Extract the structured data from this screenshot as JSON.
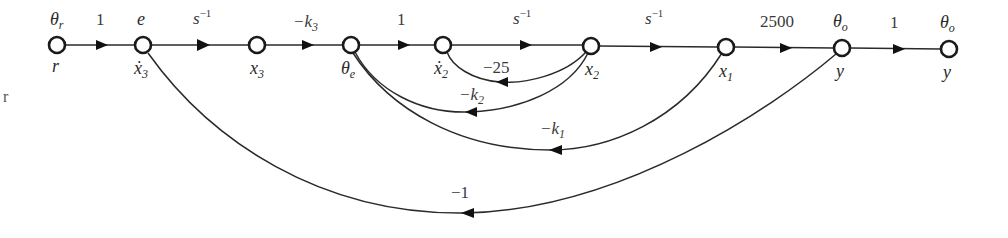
{
  "diagram": {
    "type": "signal-flow-graph",
    "stray_text": "r",
    "nodes": [
      {
        "id": "r",
        "top_label": "θ",
        "top_sub": "r",
        "bottom_label": "r",
        "bottom_sub": ""
      },
      {
        "id": "x3dot",
        "top_label": "e",
        "top_sub": "",
        "bottom_label": "ẋ",
        "bottom_sub": "3"
      },
      {
        "id": "x3",
        "top_label": "",
        "top_sub": "",
        "bottom_label": "x",
        "bottom_sub": "3"
      },
      {
        "id": "thetae",
        "top_label": "",
        "top_sub": "",
        "bottom_label": "θ",
        "bottom_sub": "e"
      },
      {
        "id": "x2dot",
        "top_label": "",
        "top_sub": "",
        "bottom_label": "ẋ",
        "bottom_sub": "2"
      },
      {
        "id": "x2",
        "top_label": "",
        "top_sub": "",
        "bottom_label": "x",
        "bottom_sub": "2"
      },
      {
        "id": "x1",
        "top_label": "",
        "top_sub": "",
        "bottom_label": "x",
        "bottom_sub": "1"
      },
      {
        "id": "y1",
        "top_label": "θ",
        "top_sub": "o",
        "bottom_label": "y",
        "bottom_sub": ""
      },
      {
        "id": "y2",
        "top_label": "θ",
        "top_sub": "o",
        "bottom_label": "y",
        "bottom_sub": ""
      }
    ],
    "forward_branches": [
      {
        "from": "r",
        "to": "x3dot",
        "gain": "1"
      },
      {
        "from": "x3dot",
        "to": "x3",
        "gain_base": "s",
        "gain_sup": "−1"
      },
      {
        "from": "x3",
        "to": "thetae",
        "gain_base": "−k",
        "gain_sub": "3"
      },
      {
        "from": "thetae",
        "to": "x2dot",
        "gain": "1"
      },
      {
        "from": "x2dot",
        "to": "x2",
        "gain_base": "s",
        "gain_sup": "−1"
      },
      {
        "from": "x2",
        "to": "x1",
        "gain_base": "s",
        "gain_sup": "−1"
      },
      {
        "from": "x1",
        "to": "y1",
        "gain": "2500"
      },
      {
        "from": "y1",
        "to": "y2",
        "gain": "1"
      }
    ],
    "feedback_branches": [
      {
        "from": "x2",
        "to": "x2dot",
        "gain": "−25"
      },
      {
        "from": "x2",
        "to": "thetae",
        "gain_base": "−k",
        "gain_sub": "2"
      },
      {
        "from": "x1",
        "to": "thetae",
        "gain_base": "−k",
        "gain_sub": "1"
      },
      {
        "from": "y1",
        "to": "x3dot",
        "gain": "−1"
      }
    ],
    "colors": {
      "stroke": "#2a2a2a",
      "node_fill": "#ffffff",
      "background": "#ffffff"
    }
  }
}
